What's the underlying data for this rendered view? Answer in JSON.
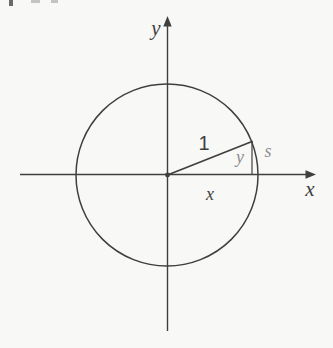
{
  "figure": {
    "colors": {
      "background": "#f8f8f6",
      "ink": "#3f3f3f",
      "muted": "#8d8d8d"
    },
    "labels": {
      "y_axis": "y",
      "x_axis": "x",
      "radius_length": "1",
      "ordinate": "y",
      "arc_length": "s",
      "abscissa": "x"
    }
  }
}
